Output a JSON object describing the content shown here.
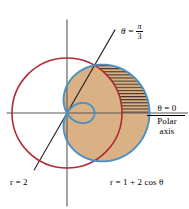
{
  "figure": {
    "kind": "polar-graph",
    "background_color": "#ffffff"
  },
  "labels": {
    "theta_line_lhs": "θ =",
    "theta_line_numerator": "π",
    "theta_line_denominator": "3",
    "theta_zero": "θ = 0",
    "polar": "Polar",
    "axis": "axis",
    "circle_equation": "r = 2",
    "limacon_equation": "r = 1 + 2 cos θ"
  },
  "colors": {
    "circle_red": "#b02b37",
    "limacon_blue": "#4a90c4",
    "region_fill": "#d9b184",
    "hatch_line": "#3a3026",
    "axis": "#58585a",
    "ray": "#262626",
    "text": "#000000"
  },
  "chart_data": {
    "type": "line",
    "title": "",
    "subtitle": "",
    "xlabel": "",
    "ylabel": "",
    "coordinate_system": "polar",
    "pole_px": [
      67,
      113
    ],
    "pixels_per_unit": 27.5,
    "xlim": [
      -2.2,
      4.4
    ],
    "ylim": [
      -3.4,
      3.4
    ],
    "grid": false,
    "legend": "none",
    "series": [
      {
        "name": "r = 2",
        "equation": "r = 2",
        "color": "#b02b37",
        "type": "circle",
        "radius": 2,
        "center": [
          0,
          0
        ]
      },
      {
        "name": "r = 1 + 2 cos θ",
        "equation": "r = 1 + 2 cos θ",
        "color": "#4a90c4",
        "type": "limacon",
        "a": 1,
        "b": 2,
        "r_max": 3,
        "inner_loop": true,
        "inner_loop_r_min": -1,
        "zero_theta": 2.0944
      }
    ],
    "annotations": [
      {
        "text": "θ = π/3",
        "type": "ray",
        "theta": 1.0472,
        "theta_degrees": 60,
        "color": "#262626"
      },
      {
        "text": "θ = 0",
        "type": "axis-label",
        "theta": 0,
        "theta_degrees": 0
      },
      {
        "text": "Polar axis",
        "type": "axis-label"
      },
      {
        "text": "r = 2",
        "type": "curve-label"
      },
      {
        "text": "r = 1 + 2 cos θ",
        "type": "curve-label"
      }
    ],
    "shaded_region": {
      "description": "Region inside the limacon r = 1 + 2 cos θ and outside the circle r = 2, from θ = -π/3 to θ = π/3, plus the lune of the limacon right of the circle.",
      "fill_color": "#d9b184",
      "hatched": true,
      "hatch_orientation": "horizontal",
      "theta_from": -1.0472,
      "theta_to": 1.0472
    },
    "intersection_points": [
      {
        "theta": 1.0472,
        "r": 2,
        "theta_degrees": 60
      },
      {
        "theta": -1.0472,
        "r": 2,
        "theta_degrees": -60
      }
    ]
  }
}
